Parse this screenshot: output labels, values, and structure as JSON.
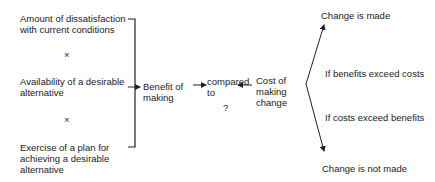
{
  "factors": [
    {
      "label": "Amount of dissatisfaction\nwith current conditions"
    },
    {
      "label": "Availability of a desirable\nalternative"
    },
    {
      "label": "Exercise of a plan for\nachieving a desirable\nalternative"
    }
  ],
  "operators": {
    "multiply_1": "×",
    "multiply_2": "×",
    "question": "?"
  },
  "nodes": {
    "benefit": "Benefit of\nmaking",
    "compared": "compared\nto",
    "cost": "Cost of\nmaking\nchange"
  },
  "outcomes": {
    "made": "Change is made",
    "not_made": "Change is not made"
  },
  "conditions": {
    "benefits_exceed": "If benefits exceed costs",
    "costs_exceed": "If costs exceed benefits"
  },
  "colors": {
    "line": "#222222",
    "text": "#222222",
    "background": "#ffffff"
  }
}
